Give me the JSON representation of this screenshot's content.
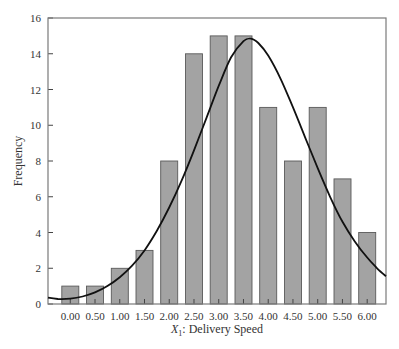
{
  "chart_data": {
    "type": "bar",
    "title": "",
    "xlabel_var": "X",
    "xlabel_sub": "1",
    "xlabel_rest": ": Delivery Speed",
    "xlabel": "X1: Delivery Speed",
    "ylabel": "Frequency",
    "ylim": [
      0,
      16
    ],
    "yticks": [
      0,
      2,
      4,
      6,
      8,
      10,
      12,
      14,
      16
    ],
    "categories": [
      "0.00",
      "0.50",
      "1.00",
      "1.50",
      "2.00",
      "2.50",
      "3.00",
      "3.50",
      "4.00",
      "4.50",
      "5.00",
      "5.50",
      "6.00"
    ],
    "values": [
      1,
      1,
      2,
      3,
      8,
      14,
      15,
      15,
      11,
      8,
      11,
      7,
      4
    ],
    "xlim": [
      -0.45,
      6.38
    ],
    "grid": false,
    "legend": null,
    "overlay": {
      "type": "line",
      "name": "fitted normal curve",
      "points": [
        [
          -0.45,
          0.35
        ],
        [
          -0.25,
          0.28
        ],
        [
          0.0,
          0.3
        ],
        [
          0.25,
          0.42
        ],
        [
          0.5,
          0.65
        ],
        [
          0.75,
          1.0
        ],
        [
          1.0,
          1.5
        ],
        [
          1.25,
          2.15
        ],
        [
          1.5,
          3.0
        ],
        [
          1.75,
          4.1
        ],
        [
          2.0,
          5.4
        ],
        [
          2.25,
          6.9
        ],
        [
          2.5,
          8.6
        ],
        [
          2.75,
          10.4
        ],
        [
          3.0,
          12.2
        ],
        [
          3.25,
          13.8
        ],
        [
          3.5,
          14.7
        ],
        [
          3.65,
          14.85
        ],
        [
          3.8,
          14.6
        ],
        [
          4.0,
          13.9
        ],
        [
          4.25,
          12.6
        ],
        [
          4.5,
          11.0
        ],
        [
          4.75,
          9.3
        ],
        [
          5.0,
          7.6
        ],
        [
          5.25,
          6.0
        ],
        [
          5.5,
          4.6
        ],
        [
          5.75,
          3.5
        ],
        [
          6.0,
          2.6
        ],
        [
          6.2,
          2.0
        ],
        [
          6.38,
          1.55
        ]
      ]
    }
  },
  "colors": {
    "bar_fill": "#a3a3a3",
    "bar_stroke": "#5a5a5a",
    "curve": "#111111",
    "axis": "#7a7a7a"
  }
}
